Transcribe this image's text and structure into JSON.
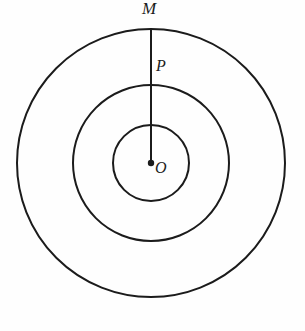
{
  "figure": {
    "name": "concentric-circles-with-radius",
    "background_color": "#fefefe",
    "stroke_color": "#1b1b1b"
  },
  "chart_data": {
    "type": "diagram",
    "title": "",
    "xlabel": "",
    "ylabel": "",
    "center": {
      "label": "O",
      "x": 151,
      "y": 163
    },
    "circles": [
      {
        "name": "inner-circle",
        "cx": 151,
        "cy": 163,
        "r": 38,
        "stroke_width": 2.0
      },
      {
        "name": "middle-circle",
        "cx": 151,
        "cy": 163,
        "r": 78,
        "stroke_width": 2.0
      },
      {
        "name": "outer-circle",
        "cx": 151,
        "cy": 163,
        "r": 134,
        "stroke_width": 2.0
      }
    ],
    "segments": [
      {
        "name": "radius-OM",
        "from": {
          "label": "O",
          "x": 151,
          "y": 163
        },
        "to": {
          "label": "M",
          "x": 151,
          "y": 29
        },
        "stroke_width": 2.0
      }
    ],
    "points": [
      {
        "label": "O",
        "x": 151,
        "y": 163,
        "marker": "filled-dot",
        "marker_radius": 3.2,
        "on": "center"
      },
      {
        "label": "P",
        "x": 151,
        "y": 85,
        "marker": "none",
        "on": "middle-circle"
      },
      {
        "label": "M",
        "x": 151,
        "y": 29,
        "marker": "none",
        "on": "outer-circle"
      }
    ],
    "labels": {
      "center_point": "O",
      "middle_intersection": "P",
      "outer_intersection": "M"
    }
  }
}
